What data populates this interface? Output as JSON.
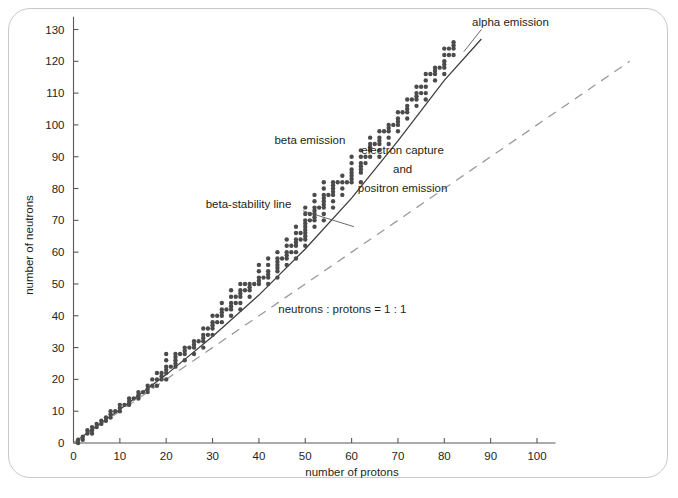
{
  "figure": {
    "background_color": "#ffffff",
    "frame_color": "#c9c9c9"
  },
  "chart_data": {
    "type": "scatter",
    "title": "",
    "subtitle": "",
    "xlabel": "number of protons",
    "ylabel": "number of neutrons",
    "xlim": [
      0,
      104
    ],
    "ylim": [
      0,
      134
    ],
    "xticks": [
      0,
      10,
      20,
      30,
      40,
      50,
      60,
      70,
      80,
      90,
      100
    ],
    "yticks": [
      0,
      10,
      20,
      30,
      40,
      50,
      60,
      70,
      80,
      90,
      100,
      110,
      120,
      130
    ],
    "xtick_labels": [
      "0",
      "10",
      "20",
      "30",
      "40",
      "50",
      "60",
      "70",
      "80",
      "90",
      "100"
    ],
    "ytick_labels": [
      "0",
      "10",
      "20",
      "30",
      "40",
      "50",
      "60",
      "70",
      "80",
      "90",
      "100",
      "110",
      "120",
      "130"
    ],
    "grid": false,
    "legend": "none",
    "marker_color": "#4b4b4b",
    "marker_size": 2.2,
    "annotations": [
      {
        "name": "alpha-emission",
        "text": "alpha emission",
        "x": 86,
        "y": 131,
        "anchor": "start"
      },
      {
        "name": "beta-emission",
        "text": "beta emission",
        "x": 51,
        "y": 94,
        "anchor": "middle"
      },
      {
        "name": "electron-capture-line1",
        "text": "electron capture",
        "x": 71,
        "y": 91,
        "anchor": "middle"
      },
      {
        "name": "electron-capture-line2",
        "text": "and",
        "x": 71,
        "y": 85,
        "anchor": "middle"
      },
      {
        "name": "electron-capture-line3",
        "text": "positron emission",
        "x": 71,
        "y": 79,
        "anchor": "middle"
      },
      {
        "name": "beta-stability-line-label",
        "text": "beta-stability line",
        "x": 47,
        "y": 74,
        "anchor": "end"
      },
      {
        "name": "ratio-label",
        "text": "neutrons : protons = 1 : 1",
        "x": 58,
        "y": 41,
        "anchor": "middle"
      }
    ],
    "series": [
      {
        "name": "beta-stability line",
        "type": "line",
        "style": "solid",
        "color": "#3c3c3c",
        "x": [
          0,
          10,
          20,
          30,
          40,
          50,
          60,
          70,
          80,
          88
        ],
        "y": [
          0,
          10.5,
          21.5,
          33.5,
          46.5,
          61,
          77,
          95,
          114,
          127
        ]
      },
      {
        "name": "neutrons : protons = 1 : 1",
        "type": "line",
        "style": "dashed",
        "color": "#9a9a9a",
        "x": [
          0,
          120
        ],
        "y": [
          0,
          120
        ]
      },
      {
        "name": "stable nuclides",
        "type": "scatter",
        "color": "#4b4b4b",
        "points": [
          [
            1,
            0
          ],
          [
            1,
            1
          ],
          [
            2,
            1
          ],
          [
            2,
            2
          ],
          [
            3,
            3
          ],
          [
            3,
            4
          ],
          [
            4,
            3
          ],
          [
            4,
            4
          ],
          [
            4,
            5
          ],
          [
            5,
            5
          ],
          [
            5,
            6
          ],
          [
            6,
            6
          ],
          [
            6,
            7
          ],
          [
            7,
            7
          ],
          [
            7,
            8
          ],
          [
            8,
            8
          ],
          [
            8,
            9
          ],
          [
            8,
            10
          ],
          [
            9,
            10
          ],
          [
            10,
            10
          ],
          [
            10,
            11
          ],
          [
            10,
            12
          ],
          [
            11,
            12
          ],
          [
            12,
            12
          ],
          [
            12,
            13
          ],
          [
            12,
            14
          ],
          [
            13,
            14
          ],
          [
            14,
            14
          ],
          [
            14,
            15
          ],
          [
            14,
            16
          ],
          [
            15,
            16
          ],
          [
            16,
            16
          ],
          [
            16,
            17
          ],
          [
            16,
            18
          ],
          [
            17,
            18
          ],
          [
            17,
            20
          ],
          [
            18,
            18
          ],
          [
            18,
            20
          ],
          [
            18,
            22
          ],
          [
            19,
            20
          ],
          [
            19,
            21
          ],
          [
            19,
            22
          ],
          [
            20,
            20
          ],
          [
            20,
            22
          ],
          [
            20,
            23
          ],
          [
            20,
            24
          ],
          [
            20,
            26
          ],
          [
            20,
            28
          ],
          [
            21,
            24
          ],
          [
            22,
            24
          ],
          [
            22,
            25
          ],
          [
            22,
            26
          ],
          [
            22,
            27
          ],
          [
            22,
            28
          ],
          [
            23,
            28
          ],
          [
            24,
            26
          ],
          [
            24,
            28
          ],
          [
            24,
            29
          ],
          [
            24,
            30
          ],
          [
            25,
            30
          ],
          [
            26,
            28
          ],
          [
            26,
            30
          ],
          [
            26,
            31
          ],
          [
            26,
            32
          ],
          [
            27,
            32
          ],
          [
            28,
            30
          ],
          [
            28,
            32
          ],
          [
            28,
            33
          ],
          [
            28,
            34
          ],
          [
            28,
            36
          ],
          [
            29,
            34
          ],
          [
            29,
            36
          ],
          [
            30,
            34
          ],
          [
            30,
            36
          ],
          [
            30,
            37
          ],
          [
            30,
            38
          ],
          [
            30,
            40
          ],
          [
            31,
            38
          ],
          [
            31,
            40
          ],
          [
            32,
            38
          ],
          [
            32,
            40
          ],
          [
            32,
            41
          ],
          [
            32,
            42
          ],
          [
            32,
            44
          ],
          [
            33,
            42
          ],
          [
            34,
            40
          ],
          [
            34,
            42
          ],
          [
            34,
            43
          ],
          [
            34,
            44
          ],
          [
            34,
            46
          ],
          [
            34,
            48
          ],
          [
            35,
            44
          ],
          [
            35,
            46
          ],
          [
            36,
            42
          ],
          [
            36,
            44
          ],
          [
            36,
            46
          ],
          [
            36,
            47
          ],
          [
            36,
            48
          ],
          [
            36,
            50
          ],
          [
            37,
            48
          ],
          [
            37,
            50
          ],
          [
            38,
            46
          ],
          [
            38,
            48
          ],
          [
            38,
            49
          ],
          [
            38,
            50
          ],
          [
            39,
            50
          ],
          [
            40,
            50
          ],
          [
            40,
            51
          ],
          [
            40,
            52
          ],
          [
            40,
            54
          ],
          [
            40,
            56
          ],
          [
            41,
            52
          ],
          [
            42,
            50
          ],
          [
            42,
            52
          ],
          [
            42,
            53
          ],
          [
            42,
            54
          ],
          [
            42,
            56
          ],
          [
            42,
            58
          ],
          [
            44,
            52
          ],
          [
            44,
            54
          ],
          [
            44,
            55
          ],
          [
            44,
            56
          ],
          [
            44,
            57
          ],
          [
            44,
            58
          ],
          [
            44,
            60
          ],
          [
            45,
            58
          ],
          [
            46,
            56
          ],
          [
            46,
            58
          ],
          [
            46,
            59
          ],
          [
            46,
            60
          ],
          [
            46,
            62
          ],
          [
            46,
            64
          ],
          [
            47,
            60
          ],
          [
            47,
            62
          ],
          [
            48,
            58
          ],
          [
            48,
            60
          ],
          [
            48,
            62
          ],
          [
            48,
            63
          ],
          [
            48,
            64
          ],
          [
            48,
            66
          ],
          [
            48,
            68
          ],
          [
            49,
            64
          ],
          [
            49,
            66
          ],
          [
            50,
            62
          ],
          [
            50,
            64
          ],
          [
            50,
            65
          ],
          [
            50,
            66
          ],
          [
            50,
            67
          ],
          [
            50,
            68
          ],
          [
            50,
            69
          ],
          [
            50,
            70
          ],
          [
            50,
            72
          ],
          [
            50,
            74
          ],
          [
            51,
            70
          ],
          [
            51,
            72
          ],
          [
            52,
            68
          ],
          [
            52,
            70
          ],
          [
            52,
            71
          ],
          [
            52,
            72
          ],
          [
            52,
            73
          ],
          [
            52,
            74
          ],
          [
            52,
            76
          ],
          [
            52,
            78
          ],
          [
            53,
            74
          ],
          [
            54,
            70
          ],
          [
            54,
            72
          ],
          [
            54,
            74
          ],
          [
            54,
            75
          ],
          [
            54,
            76
          ],
          [
            54,
            77
          ],
          [
            54,
            78
          ],
          [
            54,
            80
          ],
          [
            54,
            82
          ],
          [
            55,
            78
          ],
          [
            56,
            74
          ],
          [
            56,
            76
          ],
          [
            56,
            78
          ],
          [
            56,
            79
          ],
          [
            56,
            80
          ],
          [
            56,
            81
          ],
          [
            56,
            82
          ],
          [
            57,
            82
          ],
          [
            58,
            78
          ],
          [
            58,
            80
          ],
          [
            58,
            82
          ],
          [
            58,
            84
          ],
          [
            59,
            82
          ],
          [
            60,
            82
          ],
          [
            60,
            83
          ],
          [
            60,
            84
          ],
          [
            60,
            85
          ],
          [
            60,
            86
          ],
          [
            60,
            88
          ],
          [
            60,
            90
          ],
          [
            62,
            82
          ],
          [
            62,
            85
          ],
          [
            62,
            86
          ],
          [
            62,
            87
          ],
          [
            62,
            88
          ],
          [
            62,
            90
          ],
          [
            62,
            92
          ],
          [
            63,
            88
          ],
          [
            63,
            90
          ],
          [
            64,
            90
          ],
          [
            64,
            92
          ],
          [
            64,
            93
          ],
          [
            64,
            94
          ],
          [
            64,
            96
          ],
          [
            65,
            94
          ],
          [
            66,
            90
          ],
          [
            66,
            92
          ],
          [
            66,
            94
          ],
          [
            66,
            95
          ],
          [
            66,
            96
          ],
          [
            66,
            98
          ],
          [
            67,
            98
          ],
          [
            68,
            94
          ],
          [
            68,
            96
          ],
          [
            68,
            98
          ],
          [
            68,
            99
          ],
          [
            68,
            100
          ],
          [
            69,
            100
          ],
          [
            70,
            98
          ],
          [
            70,
            100
          ],
          [
            70,
            101
          ],
          [
            70,
            102
          ],
          [
            70,
            104
          ],
          [
            71,
            104
          ],
          [
            72,
            102
          ],
          [
            72,
            104
          ],
          [
            72,
            105
          ],
          [
            72,
            106
          ],
          [
            72,
            108
          ],
          [
            73,
            108
          ],
          [
            74,
            106
          ],
          [
            74,
            108
          ],
          [
            74,
            109
          ],
          [
            74,
            110
          ],
          [
            74,
            112
          ],
          [
            75,
            110
          ],
          [
            75,
            112
          ],
          [
            76,
            108
          ],
          [
            76,
            110
          ],
          [
            76,
            112
          ],
          [
            76,
            114
          ],
          [
            76,
            116
          ],
          [
            77,
            116
          ],
          [
            78,
            114
          ],
          [
            78,
            116
          ],
          [
            78,
            117
          ],
          [
            78,
            118
          ],
          [
            79,
            118
          ],
          [
            80,
            116
          ],
          [
            80,
            118
          ],
          [
            80,
            119
          ],
          [
            80,
            120
          ],
          [
            80,
            122
          ],
          [
            80,
            124
          ],
          [
            81,
            122
          ],
          [
            81,
            124
          ],
          [
            82,
            122
          ],
          [
            82,
            124
          ],
          [
            82,
            125
          ],
          [
            82,
            126
          ]
        ]
      }
    ]
  }
}
